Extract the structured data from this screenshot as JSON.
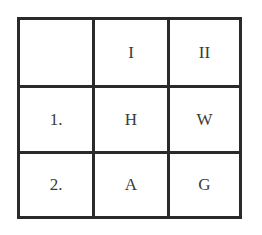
{
  "grid": {
    "header": [
      "",
      "I",
      "II"
    ],
    "rows": [
      [
        "1.",
        "H",
        "W"
      ],
      [
        "2.",
        "A",
        "G"
      ]
    ]
  }
}
